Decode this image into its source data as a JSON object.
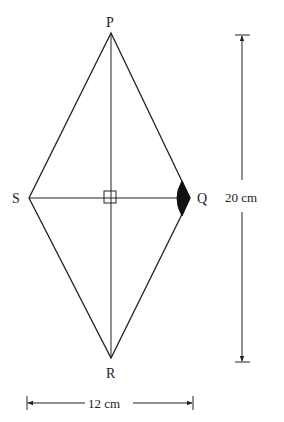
{
  "figure": {
    "type": "rhombus",
    "vertices": {
      "top": "P",
      "left": "S",
      "right": "Q",
      "bottom": "R"
    },
    "diagonals": {
      "PR": {
        "length": "20 cm",
        "label": "20 cm"
      },
      "SQ": {
        "length": "12 cm",
        "label": "12 cm"
      }
    },
    "markers": {
      "right_angle_at_center": true,
      "shaded_angle_at": "Q"
    },
    "colors": {
      "line": "#222222",
      "shade": "#111111",
      "background": "#ffffff"
    }
  },
  "labels": {
    "P": "P",
    "S": "S",
    "Q": "Q",
    "R": "R",
    "vertical_dimension": "20 cm",
    "horizontal_dimension": "12 cm"
  }
}
